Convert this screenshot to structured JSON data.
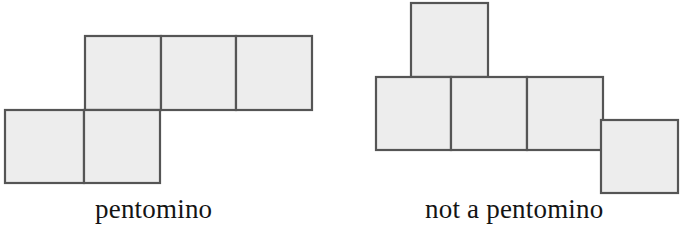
{
  "figure": {
    "background_color": "#ffffff",
    "cell_fill_color": "#ededed",
    "cell_stroke_color": "#555555",
    "caption_color": "#141414",
    "panels": [
      {
        "id": "pentomino",
        "caption": "pentomino",
        "cell_count": 5,
        "is_pentomino": true,
        "cells": [
          {
            "name": "upper-row-cell-1",
            "x": 85,
            "y": 36,
            "w": 76,
            "h": 74
          },
          {
            "name": "upper-row-cell-2",
            "x": 161,
            "y": 36,
            "w": 75,
            "h": 74
          },
          {
            "name": "upper-row-cell-3",
            "x": 236,
            "y": 36,
            "w": 76,
            "h": 74
          },
          {
            "name": "lower-row-cell-1",
            "x": 5,
            "y": 110,
            "w": 79,
            "h": 73
          },
          {
            "name": "lower-row-cell-2",
            "x": 84,
            "y": 110,
            "w": 76,
            "h": 73
          }
        ]
      },
      {
        "id": "not-a-pentomino",
        "caption": "not a pentomino",
        "cell_count": 5,
        "is_pentomino": false,
        "cells": [
          {
            "name": "top-cell",
            "x": 69,
            "y": 3,
            "w": 77,
            "h": 74
          },
          {
            "name": "middle-row-cell-1",
            "x": 34,
            "y": 77,
            "w": 75,
            "h": 73
          },
          {
            "name": "middle-row-cell-2",
            "x": 109,
            "y": 77,
            "w": 76,
            "h": 73
          },
          {
            "name": "middle-row-cell-3",
            "x": 185,
            "y": 77,
            "w": 76,
            "h": 73
          },
          {
            "name": "offset-corner-cell",
            "x": 259,
            "y": 120,
            "w": 77,
            "h": 73
          }
        ]
      }
    ]
  }
}
